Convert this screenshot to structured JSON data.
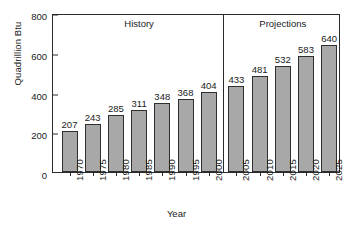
{
  "chart_data": {
    "type": "bar",
    "title": "",
    "subtitle": "",
    "xlabel": "Year",
    "ylabel": "Quadrillion Btu",
    "ylim": [
      0,
      800
    ],
    "yticks": [
      0,
      200,
      400,
      600,
      800
    ],
    "grid": false,
    "legend_position": "none",
    "bar_color": "#a8a8a8",
    "bar_edge_color": "#2f2f2f",
    "axis_color": "#2b2b2b",
    "categories": [
      "1970",
      "1975",
      "1980",
      "1985",
      "1990",
      "1995",
      "2000",
      "2005",
      "2010",
      "2015",
      "2020",
      "2025"
    ],
    "values": [
      207,
      243,
      285,
      311,
      348,
      368,
      404,
      433,
      481,
      532,
      583,
      640
    ],
    "value_labels": [
      "207",
      "243",
      "285",
      "311",
      "348",
      "368",
      "404",
      "433",
      "481",
      "532",
      "583",
      "640"
    ],
    "annotations": [
      {
        "text": "History",
        "region_start_index": 0,
        "region_end_index": 6
      },
      {
        "text": "Projections",
        "region_start_index": 7,
        "region_end_index": 11
      }
    ],
    "divider": {
      "after_category": "2000",
      "label": "history-projections-divider"
    }
  },
  "axes": {
    "y_label": "Quadrillion Btu",
    "x_label": "Year",
    "y_tick_labels": [
      "0",
      "200",
      "400",
      "600",
      "800"
    ]
  },
  "regions": {
    "history_label": "History",
    "projections_label": "Projections"
  }
}
